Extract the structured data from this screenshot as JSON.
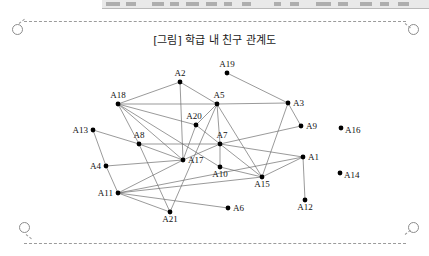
{
  "toolbar": {
    "visible": true,
    "segments": [
      {
        "x": 4,
        "w": 14
      },
      {
        "x": 24,
        "w": 10
      },
      {
        "x": 50,
        "w": 12
      },
      {
        "x": 68,
        "w": 9
      },
      {
        "x": 84,
        "w": 13
      },
      {
        "x": 104,
        "w": 11
      },
      {
        "x": 122,
        "w": 8
      },
      {
        "x": 140,
        "w": 9
      },
      {
        "x": 172,
        "w": 7
      },
      {
        "x": 188,
        "w": 9
      },
      {
        "x": 214,
        "w": 15
      },
      {
        "x": 236,
        "w": 10
      },
      {
        "x": 258,
        "w": 12
      },
      {
        "x": 278,
        "w": 9
      },
      {
        "x": 296,
        "w": 11
      }
    ]
  },
  "page": {
    "border_style": "dashed",
    "border_color": "#9b9b9b",
    "eyelet_count": 4
  },
  "figure": {
    "title": "[그림] 학급 내 친구 관계도",
    "type": "network-diagram",
    "node_color": "#000000",
    "edge_color": "#6f6f6f"
  },
  "chart_data": {
    "type": "scatter",
    "title": "[그림] 학급 내 친구 관계도",
    "xlabel": "",
    "ylabel": "",
    "grid": false,
    "legend": null,
    "nodes": [
      {
        "id": "A1",
        "label": "A1",
        "x": 303,
        "y": 157,
        "label_dx": 5,
        "label_dy": 3,
        "label_anchor": "start"
      },
      {
        "id": "A2",
        "label": "A2",
        "x": 180,
        "y": 82,
        "label_dx": 0,
        "label_dy": -6,
        "label_anchor": "middle"
      },
      {
        "id": "A3",
        "label": "A3",
        "x": 288,
        "y": 103,
        "label_dx": 5,
        "label_dy": 3,
        "label_anchor": "start"
      },
      {
        "id": "A4",
        "label": "A4",
        "x": 106,
        "y": 166,
        "label_dx": -5,
        "label_dy": 3,
        "label_anchor": "end"
      },
      {
        "id": "A5",
        "label": "A5",
        "x": 217,
        "y": 104,
        "label_dx": 2,
        "label_dy": -6,
        "label_anchor": "middle"
      },
      {
        "id": "A6",
        "label": "A6",
        "x": 228,
        "y": 208,
        "label_dx": 5,
        "label_dy": 3,
        "label_anchor": "start"
      },
      {
        "id": "A7",
        "label": "A7",
        "x": 220,
        "y": 144,
        "label_dx": 2,
        "label_dy": -6,
        "label_anchor": "middle"
      },
      {
        "id": "A8",
        "label": "A8",
        "x": 139,
        "y": 144,
        "label_dx": 0,
        "label_dy": -6,
        "label_anchor": "middle"
      },
      {
        "id": "A9",
        "label": "A9",
        "x": 301,
        "y": 126,
        "label_dx": 5,
        "label_dy": 3,
        "label_anchor": "start"
      },
      {
        "id": "A10",
        "label": "A10",
        "x": 220,
        "y": 167,
        "label_dx": 0,
        "label_dy": 10,
        "label_anchor": "middle"
      },
      {
        "id": "A11",
        "label": "A11",
        "x": 118,
        "y": 193,
        "label_dx": -5,
        "label_dy": 3,
        "label_anchor": "end"
      },
      {
        "id": "A12",
        "label": "A12",
        "x": 305,
        "y": 200,
        "label_dx": 0,
        "label_dy": 10,
        "label_anchor": "middle"
      },
      {
        "id": "A13",
        "label": "A13",
        "x": 93,
        "y": 130,
        "label_dx": -5,
        "label_dy": 3,
        "label_anchor": "end"
      },
      {
        "id": "A14",
        "label": "A14",
        "x": 340,
        "y": 173,
        "label_dx": 4,
        "label_dy": 5,
        "label_anchor": "start"
      },
      {
        "id": "A15",
        "label": "A15",
        "x": 262,
        "y": 177,
        "label_dx": 0,
        "label_dy": 10,
        "label_anchor": "middle"
      },
      {
        "id": "A16",
        "label": "A16",
        "x": 341,
        "y": 128,
        "label_dx": 4,
        "label_dy": 5,
        "label_anchor": "start"
      },
      {
        "id": "A17",
        "label": "A17",
        "x": 183,
        "y": 160,
        "label_dx": 5,
        "label_dy": 3,
        "label_anchor": "start"
      },
      {
        "id": "A18",
        "label": "A18",
        "x": 118,
        "y": 104,
        "label_dx": 0,
        "label_dy": -6,
        "label_anchor": "middle"
      },
      {
        "id": "A19",
        "label": "A19",
        "x": 227,
        "y": 73,
        "label_dx": 0,
        "label_dy": -6,
        "label_anchor": "middle"
      },
      {
        "id": "A20",
        "label": "A20",
        "x": 196,
        "y": 125,
        "label_dx": -2,
        "label_dy": -6,
        "label_anchor": "middle"
      },
      {
        "id": "A21",
        "label": "A21",
        "x": 170,
        "y": 212,
        "label_dx": 0,
        "label_dy": 10,
        "label_anchor": "middle"
      }
    ],
    "isolated_nodes": [
      "A16",
      "A14"
    ],
    "edges": [
      [
        "A18",
        "A2"
      ],
      [
        "A18",
        "A5"
      ],
      [
        "A18",
        "A8"
      ],
      [
        "A18",
        "A17"
      ],
      [
        "A18",
        "A20"
      ],
      [
        "A18",
        "A10"
      ],
      [
        "A2",
        "A5"
      ],
      [
        "A2",
        "A17"
      ],
      [
        "A19",
        "A3"
      ],
      [
        "A5",
        "A3"
      ],
      [
        "A5",
        "A7"
      ],
      [
        "A5",
        "A20"
      ],
      [
        "A5",
        "A15"
      ],
      [
        "A3",
        "A9"
      ],
      [
        "A3",
        "A15"
      ],
      [
        "A20",
        "A17"
      ],
      [
        "A20",
        "A7"
      ],
      [
        "A13",
        "A8"
      ],
      [
        "A13",
        "A4"
      ],
      [
        "A8",
        "A17"
      ],
      [
        "A8",
        "A7"
      ],
      [
        "A8",
        "A21"
      ],
      [
        "A4",
        "A17"
      ],
      [
        "A4",
        "A11"
      ],
      [
        "A17",
        "A11"
      ],
      [
        "A17",
        "A7"
      ],
      [
        "A7",
        "A10"
      ],
      [
        "A7",
        "A9"
      ],
      [
        "A7",
        "A15"
      ],
      [
        "A7",
        "A1"
      ],
      [
        "A10",
        "A15"
      ],
      [
        "A11",
        "A15"
      ],
      [
        "A11",
        "A21"
      ],
      [
        "A11",
        "A6"
      ],
      [
        "A11",
        "A1"
      ],
      [
        "A15",
        "A1"
      ],
      [
        "A1",
        "A12"
      ],
      [
        "A21",
        "A5"
      ]
    ]
  }
}
